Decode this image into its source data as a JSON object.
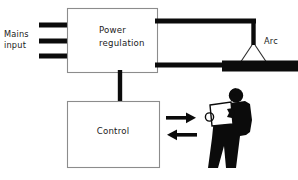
{
  "diagram": {
    "background_color": "#ffffff",
    "line_color": "#0b0b0b",
    "box_border_color": "#8c8c8c",
    "text_color": "#1a1a1a"
  },
  "labels": {
    "mains_line1": "Mains",
    "mains_line2": "input",
    "arc": "Arc"
  },
  "blocks": {
    "power_regulation": {
      "line1": "Power",
      "line2": "regulation"
    },
    "control": {
      "line1": "Control"
    }
  },
  "connections": {
    "mains_input_lines": 3,
    "power_to_control": "vertical-bus",
    "power_to_electrode": "thick-wire",
    "power_to_workpiece": "thick-wire",
    "control_to_operator": "arrow-right",
    "operator_to_control": "arrow-left"
  },
  "figures": {
    "operator": "welder-with-shield",
    "workpiece": "black-bar",
    "electrode": "vertical-rod",
    "arc_shape": "triangle"
  }
}
